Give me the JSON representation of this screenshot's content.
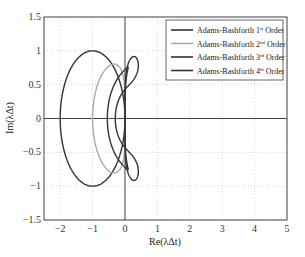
{
  "chart_data": {
    "type": "line",
    "title": "",
    "xlabel": "Re(λΔt)",
    "ylabel": "Im(λΔt)",
    "xlim": [
      -2.5,
      5
    ],
    "ylim": [
      -1.5,
      1.5
    ],
    "xticks": [
      -2,
      -1,
      0,
      1,
      2,
      3,
      4,
      5
    ],
    "yticks": [
      -1.5,
      -1,
      -0.5,
      0,
      0.5,
      1,
      1.5
    ],
    "grid": true,
    "legend_position": "upper right",
    "series": [
      {
        "name": "Adams-Bashforth 1st Order",
        "order": 1,
        "color": "#333333",
        "description": "circle centered at (-1,0) radius 1"
      },
      {
        "name": "Adams-Bashforth 2nd Order",
        "order": 2,
        "color": "#aaaaaa",
        "description": "stability boundary, Re from -1 to 0, Im up to ±0.8"
      },
      {
        "name": "Adams-Bashforth 3rd Order",
        "order": 3,
        "color": "#333333",
        "description": "stability boundary, Re from -0.55 to ~0.3, Im up to ±0.75 with loops"
      },
      {
        "name": "Adams-Bashforth 4th Order",
        "order": 4,
        "color": "#333333",
        "description": "stability boundary, Re from -0.3 to ~0.1, Im up to ±0.75 with loops"
      }
    ]
  },
  "legend": [
    {
      "base": "Adams-Bashforth 1",
      "sup": "st",
      "tail": " Order"
    },
    {
      "base": "Adams-Bashforth 2",
      "sup": "nd",
      "tail": " Order"
    },
    {
      "base": "Adams-Bashforth 3",
      "sup": "rd",
      "tail": " Order"
    },
    {
      "base": "Adams-Bashforth 4",
      "sup": "th",
      "tail": " Order"
    }
  ]
}
